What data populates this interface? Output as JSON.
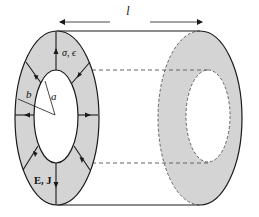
{
  "diagram": {
    "type": "coaxial-cylindrical-conductor",
    "colors": {
      "fill": "#d4d4d4",
      "stroke": "#1a1a1a",
      "background": "#ffffff"
    },
    "labels": {
      "length": "l",
      "material": "σ, ϵ",
      "outer_radius": "b",
      "inner_radius": "a",
      "fields": "E, J"
    }
  }
}
